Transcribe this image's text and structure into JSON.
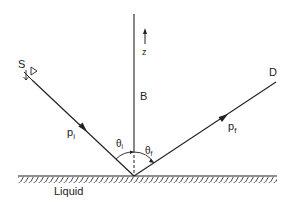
{
  "labels": {
    "source": "S",
    "detector": "D",
    "axis": "z",
    "field": "B",
    "incident_momentum": "p",
    "incident_sub": "i",
    "final_momentum": "p",
    "final_sub": "f",
    "incident_angle": "θ",
    "incident_angle_sub": "i",
    "final_angle": "θ",
    "final_angle_sub": "f",
    "surface": "Liquid"
  },
  "colors": {
    "ink": "#222222",
    "background": "#ffffff"
  }
}
